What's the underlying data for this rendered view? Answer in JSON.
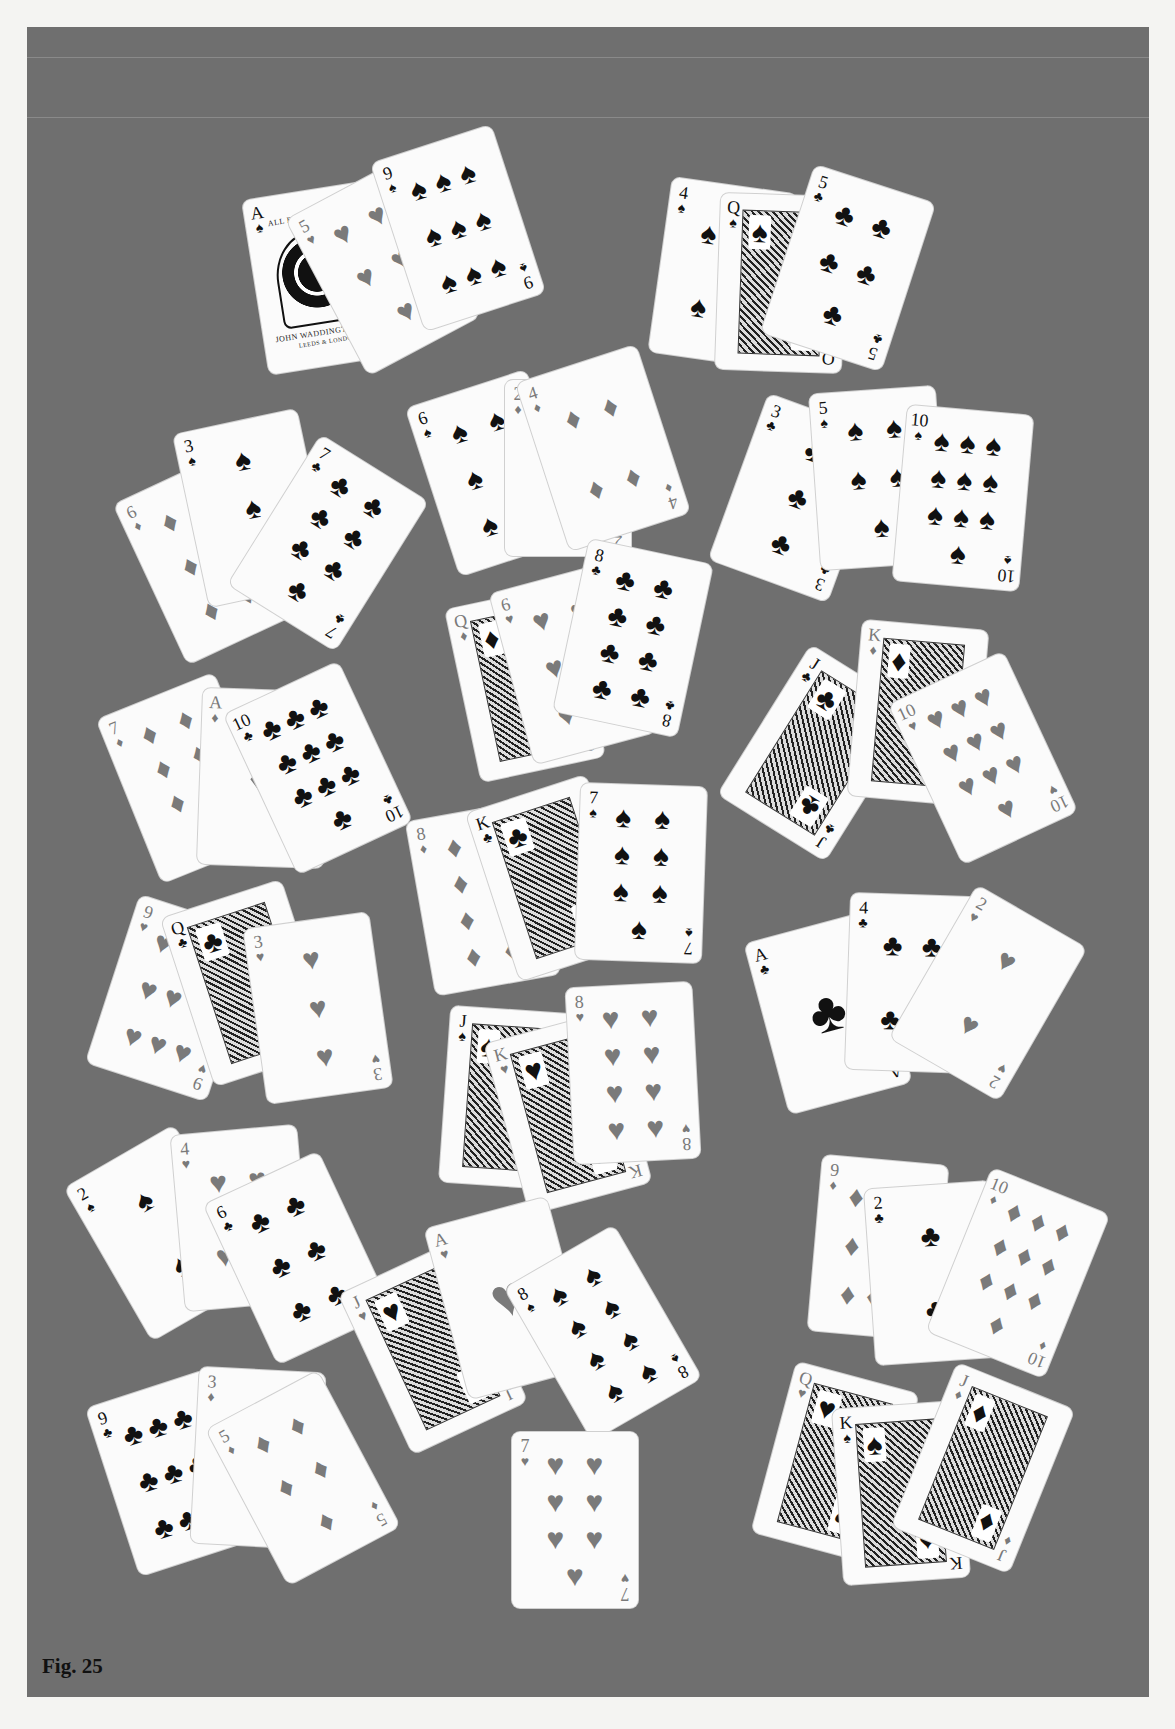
{
  "figure": {
    "caption": "Fig. 25",
    "background_color": "#6f6f6f",
    "card_color": "#fbfbfb",
    "black_suit_color": "#111111",
    "red_suit_color": "#7a7a7a"
  },
  "suits": {
    "spades": "♠",
    "hearts": "♥",
    "diamonds": "♦",
    "clubs": "♣"
  },
  "ace_of_spades_text": {
    "top": "ALL BRITISH MAKE",
    "bottom1": "JOHN WADDINGTON LTD",
    "bottom2": "LEEDS & LONDON"
  },
  "hands": [
    {
      "name": "hand-1",
      "cards": [
        {
          "rank": "A",
          "suit": "spades",
          "x": 255,
          "y": 190,
          "rot": -9,
          "special": "ace-waddington"
        },
        {
          "rank": "5",
          "suit": "hearts",
          "x": 320,
          "y": 180,
          "rot": -28
        },
        {
          "rank": "9",
          "suit": "spades",
          "x": 395,
          "y": 140,
          "rot": -18
        }
      ]
    },
    {
      "name": "hand-2",
      "cards": [
        {
          "rank": "4",
          "suit": "spades",
          "x": 660,
          "y": 185,
          "rot": 8
        },
        {
          "rank": "Q",
          "suit": "spades",
          "x": 718,
          "y": 195,
          "rot": 2,
          "court": true
        },
        {
          "rank": "5",
          "suit": "clubs",
          "x": 785,
          "y": 180,
          "rot": 18
        }
      ]
    },
    {
      "name": "hand-3",
      "cards": [
        {
          "rank": "6",
          "suit": "diamonds",
          "x": 145,
          "y": 470,
          "rot": -25
        },
        {
          "rank": "3",
          "suit": "spades",
          "x": 190,
          "y": 420,
          "rot": -12
        },
        {
          "rank": "7",
          "suit": "clubs",
          "x": 265,
          "y": 455,
          "rot": 32
        }
      ]
    },
    {
      "name": "hand-4",
      "cards": [
        {
          "rank": "6",
          "suit": "spades",
          "x": 430,
          "y": 385,
          "rot": -18
        },
        {
          "rank": "2",
          "suit": "diamonds",
          "x": 505,
          "y": 380,
          "rot": 0
        },
        {
          "rank": "4",
          "suit": "diamonds",
          "x": 540,
          "y": 360,
          "rot": -18
        }
      ]
    },
    {
      "name": "hand-5",
      "cards": [
        {
          "rank": "3",
          "suit": "clubs",
          "x": 735,
          "y": 410,
          "rot": 20
        },
        {
          "rank": "5",
          "suit": "spades",
          "x": 815,
          "y": 390,
          "rot": -4
        },
        {
          "rank": "10",
          "suit": "spades",
          "x": 900,
          "y": 410,
          "rot": 5
        }
      ]
    },
    {
      "name": "hand-6",
      "cards": [
        {
          "rank": "Q",
          "suit": "diamonds",
          "x": 462,
          "y": 595,
          "rot": -12,
          "court": true
        },
        {
          "rank": "6",
          "suit": "hearts",
          "x": 510,
          "y": 575,
          "rot": -15
        },
        {
          "rank": "8",
          "suit": "clubs",
          "x": 570,
          "y": 550,
          "rot": 12
        }
      ]
    },
    {
      "name": "hand-7",
      "cards": [
        {
          "rank": "J",
          "suit": "clubs",
          "x": 755,
          "y": 665,
          "rot": 32,
          "court": true
        },
        {
          "rank": "K",
          "suit": "diamonds",
          "x": 855,
          "y": 625,
          "rot": 5,
          "court": true
        },
        {
          "rank": "10",
          "suit": "hearts",
          "x": 920,
          "y": 670,
          "rot": -25
        }
      ]
    },
    {
      "name": "hand-8",
      "cards": [
        {
          "rank": "7",
          "suit": "diamonds",
          "x": 125,
          "y": 690,
          "rot": -22
        },
        {
          "rank": "A",
          "suit": "diamonds",
          "x": 200,
          "y": 690,
          "rot": 2
        },
        {
          "rank": "10",
          "suit": "clubs",
          "x": 255,
          "y": 680,
          "rot": -25
        }
      ]
    },
    {
      "name": "hand-9",
      "cards": [
        {
          "rank": "8",
          "suit": "diamonds",
          "x": 420,
          "y": 810,
          "rot": -10
        },
        {
          "rank": "K",
          "suit": "clubs",
          "x": 490,
          "y": 790,
          "rot": -18,
          "court": true
        },
        {
          "rank": "7",
          "suit": "spades",
          "x": 578,
          "y": 785,
          "rot": 2
        }
      ]
    },
    {
      "name": "hand-10",
      "cards": [
        {
          "rank": "9",
          "suit": "hearts",
          "x": 110,
          "y": 910,
          "rot": 18
        },
        {
          "rank": "Q",
          "suit": "clubs",
          "x": 185,
          "y": 895,
          "rot": -18,
          "court": true
        },
        {
          "rank": "3",
          "suit": "hearts",
          "x": 255,
          "y": 920,
          "rot": -8
        }
      ]
    },
    {
      "name": "hand-11",
      "cards": [
        {
          "rank": "A",
          "suit": "clubs",
          "x": 765,
          "y": 925,
          "rot": -15
        },
        {
          "rank": "4",
          "suit": "clubs",
          "x": 848,
          "y": 895,
          "rot": 2
        },
        {
          "rank": "2",
          "suit": "hearts",
          "x": 925,
          "y": 905,
          "rot": 30
        }
      ]
    },
    {
      "name": "hand-12",
      "cards": [
        {
          "rank": "J",
          "suit": "spades",
          "x": 445,
          "y": 1010,
          "rot": 4,
          "court": true
        },
        {
          "rank": "K",
          "suit": "hearts",
          "x": 505,
          "y": 1025,
          "rot": -15,
          "court": true
        },
        {
          "rank": "8",
          "suit": "hearts",
          "x": 570,
          "y": 985,
          "rot": -3
        }
      ]
    },
    {
      "name": "hand-13",
      "cards": [
        {
          "rank": "2",
          "suit": "spades",
          "x": 100,
          "y": 1145,
          "rot": -30
        },
        {
          "rank": "4",
          "suit": "hearts",
          "x": 178,
          "y": 1130,
          "rot": -5
        },
        {
          "rank": "6",
          "suit": "clubs",
          "x": 235,
          "y": 1170,
          "rot": -25
        }
      ]
    },
    {
      "name": "hand-14",
      "cards": [
        {
          "rank": "J",
          "suit": "hearts",
          "x": 370,
          "y": 1260,
          "rot": -25,
          "court": true
        },
        {
          "rank": "A",
          "suit": "hearts",
          "x": 445,
          "y": 1210,
          "rot": -15
        },
        {
          "rank": "8",
          "suit": "spades",
          "x": 540,
          "y": 1245,
          "rot": -30
        }
      ]
    },
    {
      "name": "hand-15",
      "cards": [
        {
          "rank": "9",
          "suit": "diamonds",
          "x": 815,
          "y": 1160,
          "rot": 5
        },
        {
          "rank": "2",
          "suit": "clubs",
          "x": 870,
          "y": 1185,
          "rot": -4
        },
        {
          "rank": "10",
          "suit": "diamonds",
          "x": 955,
          "y": 1185,
          "rot": 22
        }
      ]
    },
    {
      "name": "hand-16",
      "cards": [
        {
          "rank": "9",
          "suit": "clubs",
          "x": 110,
          "y": 1385,
          "rot": -18
        },
        {
          "rank": "3",
          "suit": "diamonds",
          "x": 195,
          "y": 1370,
          "rot": 3
        },
        {
          "rank": "5",
          "suit": "diamonds",
          "x": 240,
          "y": 1390,
          "rot": -28
        }
      ]
    },
    {
      "name": "hand-17",
      "cards": [
        {
          "rank": "7",
          "suit": "hearts",
          "x": 512,
          "y": 1432,
          "rot": 0
        }
      ]
    },
    {
      "name": "hand-18",
      "cards": [
        {
          "rank": "Q",
          "suit": "hearts",
          "x": 772,
          "y": 1375,
          "rot": 15,
          "court": true
        },
        {
          "rank": "K",
          "suit": "spades",
          "x": 838,
          "y": 1405,
          "rot": -4,
          "court": true
        },
        {
          "rank": "J",
          "suit": "diamonds",
          "x": 920,
          "y": 1380,
          "rot": 22,
          "court": true
        }
      ]
    }
  ]
}
